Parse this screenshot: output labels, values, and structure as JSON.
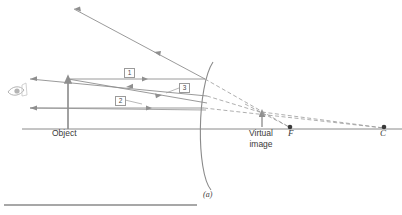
{
  "figure": {
    "caption": "(a)",
    "type": "convex-mirror-ray-diagram"
  },
  "labels": {
    "object": "Object",
    "virtual_image_line1": "Virtual",
    "virtual_image_line2": "image",
    "focal_point": "F",
    "center_of_curvature": "C"
  },
  "rays": [
    {
      "id": "1",
      "label": "1"
    },
    {
      "id": "2",
      "label": "2"
    },
    {
      "id": "3",
      "label": "3"
    }
  ],
  "icons": {
    "eye": "eye-icon"
  },
  "colors": {
    "ray": "#8f8f8f",
    "axis": "#8a8a8a",
    "mirror": "#8a8a8a",
    "dashed": "#9a9a9a",
    "object_arrow": "#8a8a8a",
    "text": "#3a3a3a",
    "rule": "#8a8a8a"
  },
  "geometry": {
    "axis_y": 129,
    "object_x": 68,
    "object_top_y": 77,
    "mirror_vertex_x": 201,
    "virtual_image_x": 262,
    "virtual_image_top_y": 112,
    "focal_point_x": 290,
    "center_x": 384
  }
}
